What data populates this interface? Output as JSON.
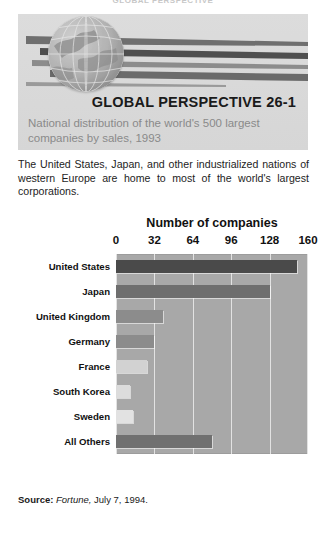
{
  "running_head": "GLOBAL PERSPECTIVE",
  "header": {
    "title": "GLOBAL PERSPECTIVE 26-1",
    "subtitle": "National distribution of the world's 500 largest companies by sales, 1993",
    "globe_icon": "globe-icon",
    "streaks_icon": "speed-streaks-icon"
  },
  "body_text": "The United States, Japan, and other industrialized nations of western Europe are home to most of the world's largest corporations.",
  "source": {
    "label": "Source:",
    "publication": "Fortune,",
    "date": "July 7, 1994."
  },
  "chart_data": {
    "type": "bar",
    "orientation": "horizontal",
    "title": "Number of companies",
    "xlabel": "Number of companies",
    "ylabel": "",
    "categories": [
      "United States",
      "Japan",
      "United Kingdom",
      "Germany",
      "France",
      "South Korea",
      "Sweden",
      "All Others"
    ],
    "values": [
      151,
      128,
      39,
      32,
      26,
      12,
      14,
      80
    ],
    "bar_colors": [
      "#4a4a4a",
      "#6e6e6e",
      "#8c8c8c",
      "#8c8c8c",
      "#d2d2d2",
      "#dcdcdc",
      "#e2e2e2",
      "#707070"
    ],
    "xlim": [
      0,
      160
    ],
    "xticks": [
      0,
      32,
      64,
      96,
      128,
      160
    ],
    "xtick_labels": [
      "0",
      "32",
      "64",
      "96",
      "128",
      "160"
    ],
    "grid": true,
    "grid_color": "#e2e2e2",
    "plot_background": "#a8a8a8",
    "legend": null
  },
  "colors": {
    "panel_gray": "#d9d9d9",
    "subtitle_gray": "#8a8a8a",
    "text_black": "#1a1a1a",
    "plot_gray": "#a8a8a8"
  }
}
